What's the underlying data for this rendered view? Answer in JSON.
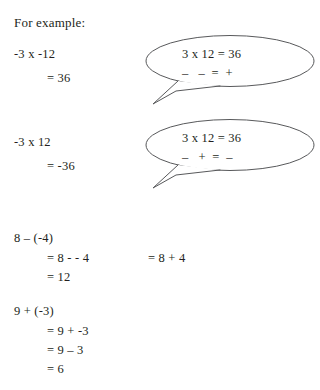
{
  "heading": "For example:",
  "examples": [
    {
      "id": "ex1",
      "lines": [
        "-3 x -12",
        "= 36"
      ]
    },
    {
      "id": "ex2",
      "lines": [
        "-3 x 12",
        "= -36"
      ]
    },
    {
      "id": "ex3",
      "lines": [
        "8 – (-4)",
        "= 8 - - 4",
        "= 12"
      ],
      "alt": "= 8 + 4"
    },
    {
      "id": "ex4",
      "lines": [
        "9 + (-3)",
        "= 9 + -3",
        "= 9 – 3",
        "= 6"
      ]
    }
  ],
  "bubbles": [
    {
      "equation": "3 x 12 = 36",
      "signs": "–   –  =  +"
    },
    {
      "equation": "3 x 12 = 36",
      "signs": "–   +  =  –"
    }
  ],
  "colors": {
    "text": "#231f20",
    "outline": "#58595b",
    "background": "#ffffff"
  }
}
